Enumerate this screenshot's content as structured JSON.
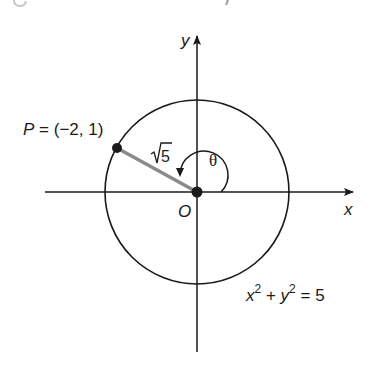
{
  "figure": {
    "type": "unit-circle-style diagram",
    "colors": {
      "background": "#ffffff",
      "ink": "#1a1a1a",
      "radius_segment": "#8a8a8a",
      "clipped_text": "#c8c8c8"
    },
    "axes": {
      "x_label": "x",
      "y_label": "y",
      "origin_label": "O"
    },
    "circle": {
      "equation": {
        "x_var": "x",
        "x_exp": "2",
        "plus": " + ",
        "y_var": "y",
        "y_exp": "2",
        "equals": " = ",
        "rhs": "5"
      }
    },
    "point": {
      "name": "P",
      "equals": " = ",
      "coords": "(−2, 1)"
    },
    "radius": {
      "label_radical": "√",
      "label_value": "5"
    },
    "angle": {
      "label": "θ"
    }
  }
}
